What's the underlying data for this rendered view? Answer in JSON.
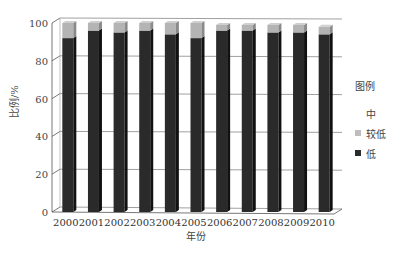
{
  "chart_data": {
    "type": "bar",
    "stacked": true,
    "three_d": true,
    "title": "",
    "xlabel": "年份",
    "ylabel": "比例/%",
    "ylim": [
      0,
      100
    ],
    "yticks": [
      0,
      20,
      40,
      60,
      80,
      100
    ],
    "grid": true,
    "legend_position": "right",
    "legend_title": "图例",
    "categories": [
      "2000",
      "2001",
      "2002",
      "2003",
      "2004",
      "2005",
      "2006",
      "2007",
      "2008",
      "2009",
      "2010"
    ],
    "series": [
      {
        "name": "低",
        "color": "#2b2b2b",
        "values": [
          92,
          96,
          95,
          96,
          94,
          92,
          96,
          96,
          95,
          95,
          94
        ]
      },
      {
        "name": "较低",
        "color": "#aaaaaa",
        "values": [
          8,
          4,
          5,
          4,
          6,
          8,
          3,
          3,
          4,
          4,
          4
        ]
      },
      {
        "name": "中",
        "color": "#ffffff",
        "values": [
          0,
          0,
          0,
          0,
          0,
          0,
          0,
          0,
          0,
          0,
          0
        ]
      }
    ]
  },
  "legend": {
    "title": "图例",
    "items": [
      {
        "label": "中",
        "color": "#ffffff"
      },
      {
        "label": "较低",
        "color": "#bdbdbd"
      },
      {
        "label": "低",
        "color": "#2b2b2b"
      }
    ]
  },
  "axes": {
    "xlabel": "年份",
    "ylabel": "比例/%"
  }
}
